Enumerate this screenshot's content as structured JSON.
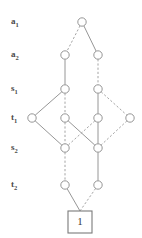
{
  "diagram": {
    "kind": "binary-decision-diagram",
    "width": 142,
    "height": 238,
    "background_color": "#ffffff",
    "node_stroke_color": "#8a8a8a",
    "node_fill_color": "#ffffff",
    "edge_solid_color": "#8a8a8a",
    "edge_dashed_color": "#9a9a9a",
    "label_color": "#4a4a4a",
    "terminal_stroke_color": "#7a7a7a",
    "node_radius": 4.2,
    "edge_legend": {
      "solid": "1-branch",
      "dashed": "0-branch"
    },
    "row_labels": [
      {
        "id": "a1",
        "base": "a",
        "sub": "1",
        "text": "a1",
        "x": 11,
        "y": 22
      },
      {
        "id": "a2",
        "base": "a",
        "sub": "2",
        "text": "a2",
        "x": 11,
        "y": 55
      },
      {
        "id": "s1",
        "base": "s",
        "sub": "1",
        "text": "s1",
        "x": 11,
        "y": 89
      },
      {
        "id": "t1",
        "base": "t",
        "sub": "1",
        "text": "t1",
        "x": 11,
        "y": 118
      },
      {
        "id": "s2",
        "base": "s",
        "sub": "2",
        "text": "s2",
        "x": 11,
        "y": 148
      },
      {
        "id": "t2",
        "base": "t",
        "sub": "2",
        "text": "t2",
        "x": 11,
        "y": 185
      }
    ],
    "nodes": [
      {
        "id": "n_a1",
        "row": "a1",
        "x": 82,
        "y": 22
      },
      {
        "id": "n_a2_L",
        "row": "a2",
        "x": 65,
        "y": 55
      },
      {
        "id": "n_a2_R",
        "row": "a2",
        "x": 98,
        "y": 55
      },
      {
        "id": "n_s1_L",
        "row": "s1",
        "x": 65,
        "y": 89
      },
      {
        "id": "n_s1_R",
        "row": "s1",
        "x": 98,
        "y": 89
      },
      {
        "id": "n_t1_A",
        "row": "t1",
        "x": 32,
        "y": 118
      },
      {
        "id": "n_t1_B",
        "row": "t1",
        "x": 65,
        "y": 118
      },
      {
        "id": "n_t1_C",
        "row": "t1",
        "x": 98,
        "y": 118
      },
      {
        "id": "n_t1_D",
        "row": "t1",
        "x": 130,
        "y": 118
      },
      {
        "id": "n_s2_L",
        "row": "s2",
        "x": 65,
        "y": 148
      },
      {
        "id": "n_s2_R",
        "row": "s2",
        "x": 98,
        "y": 148
      },
      {
        "id": "n_t2_L",
        "row": "t2",
        "x": 65,
        "y": 185
      },
      {
        "id": "n_t2_R",
        "row": "t2",
        "x": 98,
        "y": 185
      }
    ],
    "edges": [
      {
        "id": "e1",
        "from": "n_a1",
        "to": "n_a2_L",
        "style": "dashed"
      },
      {
        "id": "e2",
        "from": "n_a1",
        "to": "n_a2_R",
        "style": "solid"
      },
      {
        "id": "e3",
        "from": "n_a2_L",
        "to": "n_s1_L",
        "style": "solid"
      },
      {
        "id": "e4",
        "from": "n_a2_R",
        "to": "n_s1_R",
        "style": "dashed"
      },
      {
        "id": "e5",
        "from": "n_s1_L",
        "to": "n_t1_A",
        "style": "solid"
      },
      {
        "id": "e6",
        "from": "n_s1_L",
        "to": "n_t1_B",
        "style": "dashed"
      },
      {
        "id": "e7",
        "from": "n_s1_R",
        "to": "n_t1_C",
        "style": "solid"
      },
      {
        "id": "e8",
        "from": "n_s1_R",
        "to": "n_t1_D",
        "style": "dashed"
      },
      {
        "id": "e9",
        "from": "n_t1_A",
        "to": "n_s2_L",
        "style": "solid"
      },
      {
        "id": "e10",
        "from": "n_t1_B",
        "to": "n_s2_L",
        "style": "dashed"
      },
      {
        "id": "e11",
        "from": "n_t1_B",
        "to": "n_s2_R",
        "style": "solid"
      },
      {
        "id": "e12",
        "from": "n_t1_C",
        "to": "n_s2_L",
        "style": "dashed"
      },
      {
        "id": "e13",
        "from": "n_t1_C",
        "to": "n_s2_R",
        "style": "solid"
      },
      {
        "id": "e14",
        "from": "n_t1_D",
        "to": "n_s2_R",
        "style": "dashed"
      },
      {
        "id": "e15",
        "from": "n_s2_L",
        "to": "n_t2_L",
        "style": "dashed"
      },
      {
        "id": "e16",
        "from": "n_s2_R",
        "to": "n_t2_R",
        "style": "solid"
      },
      {
        "id": "e17",
        "from": "n_t2_L",
        "to": "terminal_1",
        "style": "solid"
      },
      {
        "id": "e18",
        "from": "n_t2_R",
        "to": "terminal_1",
        "style": "dashed"
      }
    ],
    "terminal": {
      "id": "terminal_1",
      "label": "1",
      "x": 68,
      "y": 211,
      "width": 24,
      "height": 22,
      "cx": 80,
      "cy": 222
    }
  }
}
